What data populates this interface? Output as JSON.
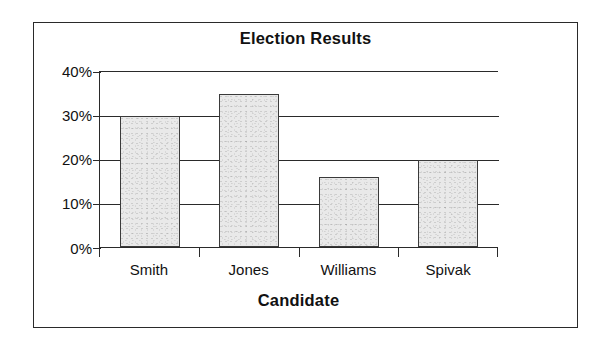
{
  "chart_data": {
    "type": "bar",
    "title": "Election Results",
    "xlabel": "Candidate",
    "ylabel": "",
    "categories": [
      "Smith",
      "Jones",
      "Williams",
      "Spivak"
    ],
    "values": [
      30,
      35,
      16,
      20
    ],
    "value_labels": [
      "30%",
      "35%",
      "16%",
      "20%"
    ],
    "ylim": [
      0,
      40
    ],
    "ytick_values": [
      40,
      30,
      20,
      10,
      0
    ],
    "ytick_labels": [
      "40%",
      "30%",
      "20%",
      "10%",
      "0%"
    ],
    "grid": "horizontal",
    "legend": "none",
    "bar_fill_color": "#e9e9e9",
    "bar_border_color": "#3a3a3a",
    "axis_color": "#2a2a2a",
    "background_color": "#ffffff"
  }
}
